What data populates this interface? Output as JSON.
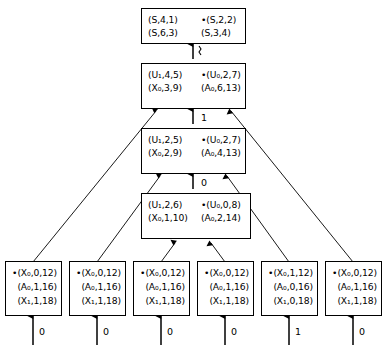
{
  "diagram": {
    "stroke_color": "#000000",
    "background_color": "#ffffff"
  },
  "spine_nodes": [
    {
      "id": "state-0",
      "rows": [
        {
          "left": {
            "dot": "",
            "text": "(S,4,1)"
          },
          "right": {
            "dot": "•",
            "text": "(S,2,2)"
          }
        },
        {
          "left": {
            "dot": "",
            "text": "(S,6,3)"
          },
          "right": {
            "dot": "",
            "text": "(S,3,4)"
          }
        }
      ]
    },
    {
      "id": "state-1",
      "rows": [
        {
          "left": {
            "dot": "",
            "text": "(U₁,4,5)"
          },
          "right": {
            "dot": "•",
            "text": "(U₀,2,7)"
          }
        },
        {
          "left": {
            "dot": "",
            "text": "(X₀,3,9)"
          },
          "right": {
            "dot": "",
            "text": "(A₀,6,13)"
          }
        }
      ]
    },
    {
      "id": "state-2",
      "rows": [
        {
          "left": {
            "dot": "",
            "text": "(U₁,2,5)"
          },
          "right": {
            "dot": "•",
            "text": "(U₀,2,7)"
          }
        },
        {
          "left": {
            "dot": "",
            "text": "(X₀,2,9)"
          },
          "right": {
            "dot": "",
            "text": "(A₀,4,13)"
          }
        }
      ]
    },
    {
      "id": "state-3",
      "rows": [
        {
          "left": {
            "dot": "",
            "text": "(U₁,2,6)"
          },
          "right": {
            "dot": "•",
            "text": "(U₀,0,8)"
          }
        },
        {
          "left": {
            "dot": "",
            "text": "(X₀,1,10)"
          },
          "right": {
            "dot": "",
            "text": "(A₀,2,14)"
          }
        }
      ]
    }
  ],
  "spine_edge_labels": [
    {
      "id": "edge-0-1",
      "label": ""
    },
    {
      "id": "edge-1-2",
      "label": "1"
    },
    {
      "id": "edge-2-3",
      "label": "0"
    }
  ],
  "leaf_nodes": [
    {
      "id": "leaf-1",
      "rows": [
        {
          "dot": "•",
          "text": "(X₀,0,12)"
        },
        {
          "dot": "",
          "text": "(A₀,1,16)"
        },
        {
          "dot": "",
          "text": "(X₁,1,18)"
        }
      ],
      "terminal": "0"
    },
    {
      "id": "leaf-2",
      "rows": [
        {
          "dot": "•",
          "text": "(X₀,0,12)"
        },
        {
          "dot": "",
          "text": "(A₀,1,16)"
        },
        {
          "dot": "",
          "text": "(X₁,1,18)"
        }
      ],
      "terminal": "0"
    },
    {
      "id": "leaf-3",
      "rows": [
        {
          "dot": "•",
          "text": "(X₀,0,12)"
        },
        {
          "dot": "",
          "text": "(A₀,1,16)"
        },
        {
          "dot": "",
          "text": "(X₁,1,18)"
        }
      ],
      "terminal": "0"
    },
    {
      "id": "leaf-4",
      "rows": [
        {
          "dot": "•",
          "text": "(X₀,0,12)"
        },
        {
          "dot": "",
          "text": "(A₀,1,16)"
        },
        {
          "dot": "",
          "text": "(X₁,1,18)"
        }
      ],
      "terminal": "0"
    },
    {
      "id": "leaf-5",
      "rows": [
        {
          "dot": "•",
          "text": "(X₀,1,12)"
        },
        {
          "dot": "",
          "text": "(A₀,0,16)"
        },
        {
          "dot": "",
          "text": "(X₁,0,18)"
        }
      ],
      "terminal": "1"
    },
    {
      "id": "leaf-6",
      "rows": [
        {
          "dot": "•",
          "text": "(X₀,0,12)"
        },
        {
          "dot": "",
          "text": "(A₀,1,16)"
        },
        {
          "dot": "",
          "text": "(X₁,1,18)"
        }
      ],
      "terminal": "0"
    }
  ]
}
